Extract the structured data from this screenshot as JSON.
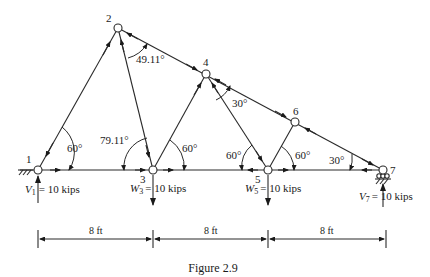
{
  "figure": {
    "caption": "Figure 2.9",
    "joints": [
      {
        "id": "1",
        "label": "1",
        "x": 38,
        "y": 170
      },
      {
        "id": "2",
        "label": "2",
        "x": 118,
        "y": 28
      },
      {
        "id": "3",
        "label": "3",
        "x": 153,
        "y": 170
      },
      {
        "id": "4",
        "label": "4",
        "x": 206,
        "y": 74
      },
      {
        "id": "5",
        "label": "5",
        "x": 268,
        "y": 170
      },
      {
        "id": "6",
        "label": "6",
        "x": 295,
        "y": 122
      },
      {
        "id": "7",
        "label": "7",
        "x": 383,
        "y": 170
      }
    ],
    "members": [
      [
        "1",
        "2"
      ],
      [
        "2",
        "3"
      ],
      [
        "2",
        "4"
      ],
      [
        "3",
        "4"
      ],
      [
        "4",
        "5"
      ],
      [
        "4",
        "6"
      ],
      [
        "5",
        "6"
      ],
      [
        "6",
        "7"
      ],
      [
        "1",
        "3"
      ],
      [
        "3",
        "5"
      ],
      [
        "5",
        "7"
      ]
    ],
    "angles": {
      "a1": "60°",
      "a2": "49.11°",
      "a3": "79.11°",
      "a4": "60°",
      "a5": "30°",
      "a6": "60°",
      "a7": "60°",
      "a8": "30°"
    },
    "loads": {
      "v1_sym": "V",
      "v1_sub": "1",
      "v1_val": "= 10 kips",
      "w3_sym": "W",
      "w3_sub": "3",
      "w3_val": "= 10 kips",
      "w5_sym": "W",
      "w5_sub": "5",
      "w5_val": "= 10 kips",
      "v7_sym": "V",
      "v7_sub": "7",
      "v7_val": "= 10 kips"
    },
    "dimensions": [
      "8 ft",
      "8 ft",
      "8 ft"
    ]
  }
}
